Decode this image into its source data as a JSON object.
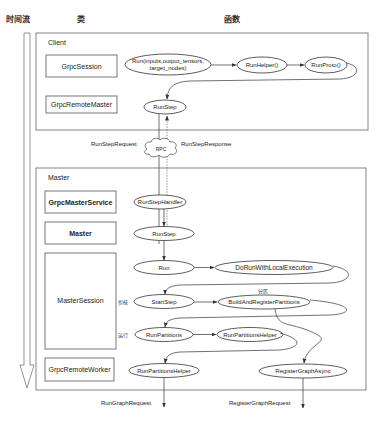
{
  "header": {
    "timeline_label": "时间流",
    "class_column_label": "类",
    "function_column_label": "函数"
  },
  "client": {
    "group_label": "Client",
    "classes": {
      "grpc_session": "GrpcSession",
      "grpc_remote_master": "GrpcRemoteMaster"
    },
    "functions": {
      "run_line1": "Run(inputs,output_tensors,",
      "run_line2": "target_nodes)",
      "run_helper": "RunHelper()",
      "run_proto": "RunProto()",
      "run_step": "RunStep"
    }
  },
  "rpc": {
    "label": "RPC",
    "request_label": "RunStepRequest",
    "response_label": "RunStepResponse"
  },
  "master": {
    "group_label": "Master",
    "classes": {
      "grpc_master_service": "GrpcMasterService",
      "master": "Master",
      "master_session": "MasterSession",
      "grpc_remote_worker": "GrpcRemoteWorker"
    },
    "functions": {
      "run_step_handler": "RunStepHandler",
      "run_step": "RunStep",
      "run": "Run",
      "do_run_with_local_execution": "DoRunWithLocalExecution",
      "start_step": "StartStep",
      "build_and_register_partitions": "BuildAndRegisterPartitions",
      "run_partitions": "RunPartitions",
      "run_partitions_helper": "RunPartitionsHelper",
      "worker_run_partitions_helper": "RunPartitionsHelper",
      "register_graph_async": "RegisterGraphAsync"
    },
    "annotations": {
      "prune": "剪枝",
      "run": "运行",
      "partition": "分区"
    }
  },
  "outputs": {
    "run_graph_request": "RunGraphRequest",
    "register_graph_request": "RegisterGraphRequest"
  }
}
